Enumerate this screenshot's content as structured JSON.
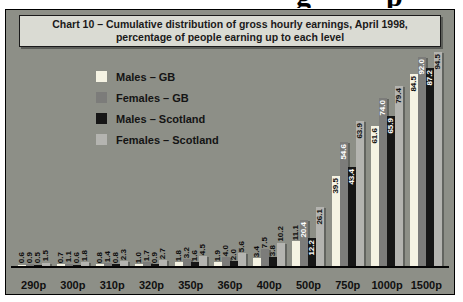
{
  "page": {
    "cropped_heading_fragments": [
      "g",
      "p"
    ]
  },
  "chart_data": {
    "type": "bar",
    "title_line1": "Chart 10 – Cumulative distribution of gross hourly earnings, April 1998,",
    "title_line2": "percentage of people earning up to each level",
    "xlabel": "",
    "ylabel": "",
    "ylim": [
      0,
      100
    ],
    "grid": false,
    "legend_position": "top-left",
    "panel_background": "#8d8f87",
    "title_background": "#dadbd3",
    "categories": [
      "290p",
      "300p",
      "310p",
      "320p",
      "350p",
      "360p",
      "400p",
      "500p",
      "750p",
      "1000p",
      "1500p"
    ],
    "series": [
      {
        "name": "Males – GB",
        "color": "#f5f3e3",
        "label_color": "#111111",
        "values": [
          "0.6",
          "0.7",
          "0.8",
          "1.0",
          "1.8",
          "1.9",
          "3.4",
          "11.1",
          "39.5",
          "61.6",
          "84.5"
        ]
      },
      {
        "name": "Females – GB",
        "color": "#7c7c7a",
        "label_color": "#ffffff",
        "values": [
          "0.9",
          "1.1",
          "1.4",
          "1.7",
          "3.2",
          "4.0",
          "7.5",
          "20.4",
          "54.6",
          "74.0",
          "92.0"
        ]
      },
      {
        "name": "Males – Scotland",
        "color": "#161616",
        "label_color": "#ffffff",
        "values": [
          "0.5",
          "0.6",
          "0.8",
          "0.9",
          "1.6",
          "2.0",
          "3.8",
          "12.2",
          "43.4",
          "65.9",
          "87.2"
        ]
      },
      {
        "name": "Females – Scotland",
        "color": "#b4b4b0",
        "label_color": "#111111",
        "values": [
          "1.5",
          "1.8",
          "2.3",
          "2.7",
          "4.5",
          "5.6",
          "10.2",
          "26.1",
          "63.9",
          "79.4",
          "94.5"
        ]
      }
    ]
  }
}
